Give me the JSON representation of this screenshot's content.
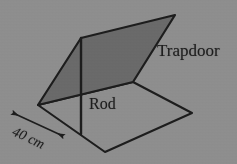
{
  "figure": {
    "name": "trapdoor-and-rod-diagram",
    "background_color": "#8e8e8e",
    "line_color": "#1d1d1d",
    "shaded_fill_color": "#6a6a6a",
    "text_color": "#1d1d1d"
  },
  "labels": {
    "trapdoor": "Trapdoor",
    "rod": "Rod",
    "dimension": "40 cm"
  },
  "geometry": {
    "floor": {
      "name": "floor-parallelogram",
      "filled": false,
      "points": "38,105 133,82 192,113 105,152"
    },
    "trapdoor": {
      "name": "trapdoor-parallelogram",
      "filled": true,
      "points": "38,105 81,38 175,15 133,82"
    },
    "rod": {
      "name": "rod-line",
      "x1": 81,
      "y1": 38,
      "x2": 81,
      "y2": 134
    },
    "dimension_arrow": {
      "name": "dimension-arrow-40cm",
      "x1": 13,
      "y1": 113,
      "x2": 63,
      "y2": 136,
      "double_headed": true
    }
  }
}
